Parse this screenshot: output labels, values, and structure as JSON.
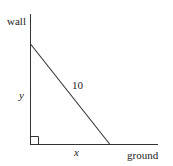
{
  "diagram": {
    "labels": {
      "wall": "wall",
      "ground": "ground",
      "height": "y",
      "base": "x",
      "hypotenuse": "10"
    },
    "colors": {
      "line": "#333333",
      "text": "#222222",
      "background": "#ffffff"
    },
    "right_angle_marker": true
  }
}
